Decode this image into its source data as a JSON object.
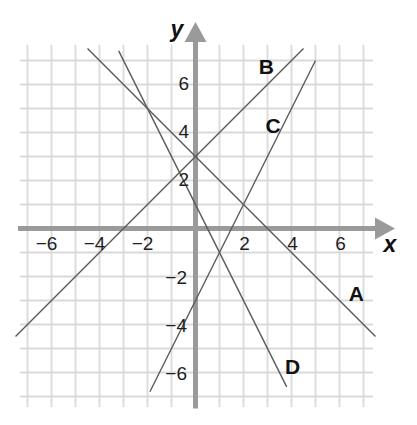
{
  "chart_data": {
    "type": "line",
    "title": "",
    "xlabel": "x",
    "ylabel": "y",
    "xlim": [
      -7,
      7
    ],
    "ylim": [
      -7,
      7
    ],
    "grid": true,
    "grid_step": 1,
    "legend": "inline letter labels next to each line",
    "xticks": [
      -6,
      -4,
      -2,
      2,
      4,
      6
    ],
    "xtick_labels": [
      "−6",
      "−4",
      "−2",
      "2",
      "4",
      "6"
    ],
    "yticks": [
      -6,
      -4,
      -2,
      2,
      4,
      6
    ],
    "ytick_labels": [
      "−6",
      "−4",
      "−2",
      "2",
      "4",
      "6"
    ],
    "series": [
      {
        "name": "A",
        "slope": -1,
        "intercept": 3,
        "points": [
          [
            -4.5,
            7.5
          ],
          [
            7.5,
            -4.5
          ]
        ],
        "label_pos": [
          6.7,
          -2.7
        ]
      },
      {
        "name": "B",
        "slope": 1,
        "intercept": 3,
        "points": [
          [
            -7.5,
            -4.5
          ],
          [
            4.5,
            7.5
          ]
        ],
        "label_pos": [
          2.95,
          6.75
        ]
      },
      {
        "name": "C",
        "slope": 2,
        "intercept": -3,
        "points": [
          [
            -1.9,
            -6.8
          ],
          [
            5.0,
            7.0
          ]
        ],
        "label_pos": [
          3.23,
          4.31
        ]
      },
      {
        "name": "D",
        "slope": -2,
        "intercept": 1,
        "points": [
          [
            -3.2,
            7.4
          ],
          [
            3.8,
            -6.6
          ]
        ],
        "label_pos": [
          4.05,
          -5.73
        ]
      }
    ],
    "axis_label_pos": {
      "x": [
        8.1,
        -0.98
      ],
      "y": [
        -0.77,
        7.98
      ]
    }
  },
  "colors": {
    "grid": "#dadada",
    "axis": "#9a9a9a",
    "line": "#5a5a5a",
    "text": "#1e1e1e"
  }
}
